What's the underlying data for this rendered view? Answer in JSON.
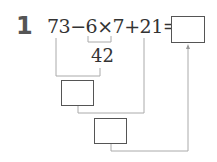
{
  "problem": {
    "number": "1",
    "expression": "73−6×7+21=",
    "partial_result": "42",
    "answer_box_value": "",
    "step1_box_value": "",
    "step2_box_value": ""
  },
  "colors": {
    "text": "#333333",
    "number": "#555555",
    "lines": "#aaaaaa",
    "box_border": "#555555"
  }
}
